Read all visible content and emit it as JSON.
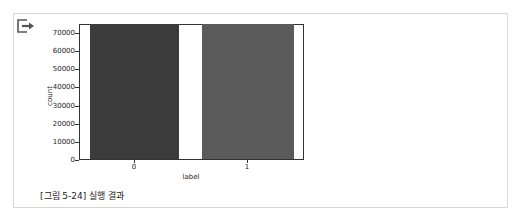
{
  "output_icon": "output-arrow-icon",
  "caption": "[그림 5-24] 실행 결과",
  "colors": {
    "bar0": "#3b3b3b",
    "bar1": "#5a5a5a",
    "axes": "#333333"
  },
  "chart_data": {
    "type": "bar",
    "title": "",
    "categories": [
      "0",
      "1"
    ],
    "values": [
      75000,
      75000
    ],
    "xlabel": "label",
    "ylabel": "count",
    "ylim": [
      0,
      80000
    ],
    "yticks": [
      0,
      10000,
      20000,
      30000,
      40000,
      50000,
      60000,
      70000
    ],
    "grid": false,
    "legend": null
  }
}
